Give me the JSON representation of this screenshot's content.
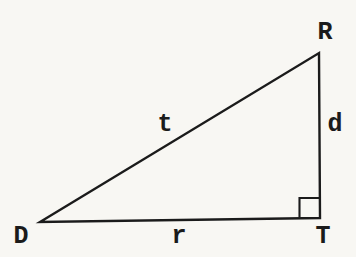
{
  "figure": {
    "type": "geometry-diagram",
    "shape": "right-triangle",
    "background_color": "#f8f7f3",
    "line_color": "#1b1b1b",
    "vertex_labels": {
      "top_right": "R",
      "bottom_left": "D",
      "bottom_right": "T"
    },
    "side_labels": {
      "hypotenuse": "t",
      "vertical_leg": "d",
      "horizontal_leg": "r"
    },
    "right_angle_vertex": "T"
  }
}
